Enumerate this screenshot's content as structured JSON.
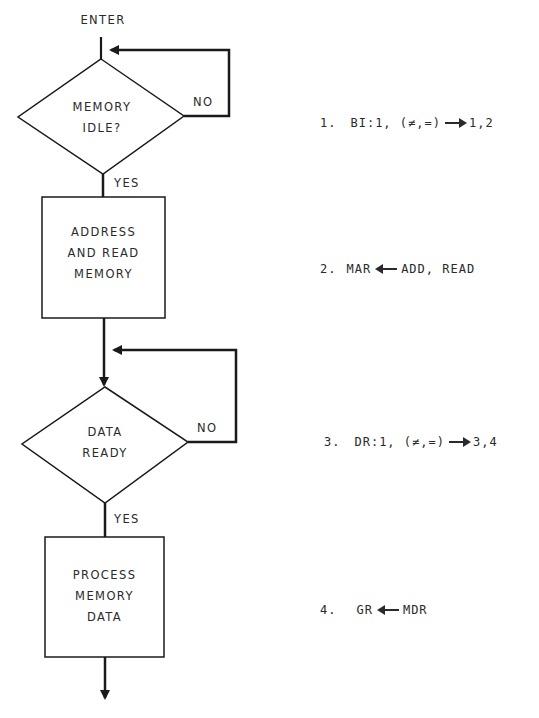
{
  "flowchart": {
    "enter_label": "ENTER",
    "nodes": [
      {
        "id": "memory-idle",
        "type": "decision",
        "lines": [
          "MEMORY",
          "IDLE?"
        ],
        "yes_label": "YES",
        "no_label": "NO"
      },
      {
        "id": "address-read",
        "type": "process",
        "lines": [
          "ADDRESS",
          "AND READ",
          "MEMORY"
        ]
      },
      {
        "id": "data-ready",
        "type": "decision",
        "lines": [
          "DATA",
          "READY"
        ],
        "yes_label": "YES",
        "no_label": "NO"
      },
      {
        "id": "process-data",
        "type": "process",
        "lines": [
          "PROCESS",
          "MEMORY",
          "DATA"
        ]
      }
    ]
  },
  "steps": [
    {
      "num": "1.",
      "lhs": "BI:1, (≠,=)",
      "arrow": "right",
      "rhs": "1,2"
    },
    {
      "num": "2.",
      "lhs": "MAR",
      "arrow": "left",
      "rhs": "ADD, READ"
    },
    {
      "num": "3.",
      "lhs": "DR:1, (≠,=)",
      "arrow": "right",
      "rhs": "3,4"
    },
    {
      "num": "4.",
      "lhs": "GR",
      "arrow": "left",
      "rhs": "MDR"
    }
  ],
  "colors": {
    "ink": "#1a1a1a",
    "text": "#2a2a2a",
    "background": "#ffffff"
  }
}
